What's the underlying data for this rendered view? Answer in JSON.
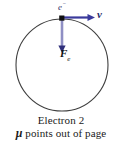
{
  "figure": {
    "title_caption": "Electron 2",
    "note_caption_symbol": "μ",
    "note_caption_text": " points out of page",
    "particle_label": "e",
    "particle_label_superscript": "−",
    "velocity_label": "v",
    "force_label": "F",
    "force_label_subscript": "e",
    "colors": {
      "orbit_stroke": "#3f3f3f",
      "velocity_arrow": "#3a3a9c",
      "force_arrow": "#8f8fc4",
      "force_arrowhead": "#2f2f7a",
      "particle_dot": "#101010",
      "background": "#ffffff",
      "caption_text": "#1a1a1a"
    },
    "geometry": {
      "circle_center_x": 62,
      "circle_center_y": 65,
      "circle_radius": 46,
      "particle_x": 62,
      "particle_y": 19,
      "velocity_arrow_end_x": 95,
      "force_arrow_end_y": 52
    }
  }
}
